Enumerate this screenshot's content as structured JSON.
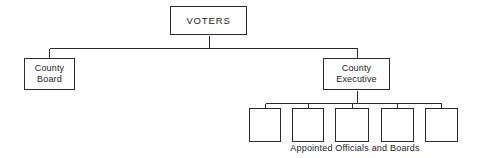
{
  "diagram": {
    "type": "organization-chart",
    "width": 482,
    "height": 158,
    "background_color": "#ffffff",
    "line_color": "#2b2b2b",
    "text_color": "#1a1a1a"
  },
  "nodes": {
    "voters": {
      "label": "VOTERS",
      "x": 170,
      "y": 6,
      "width": 77,
      "height": 29
    },
    "county_board": {
      "label": "County\nBoard",
      "x": 24,
      "y": 58,
      "width": 51,
      "height": 32
    },
    "county_executive": {
      "label": "County\nExecutive",
      "x": 323,
      "y": 58,
      "width": 67,
      "height": 32
    }
  },
  "appointed_boxes": [
    {
      "label": "",
      "x": 249,
      "y": 108,
      "width": 32,
      "height": 34
    },
    {
      "label": "",
      "x": 292,
      "y": 108,
      "width": 32,
      "height": 34
    },
    {
      "label": "",
      "x": 335,
      "y": 108,
      "width": 34,
      "height": 34
    },
    {
      "label": "",
      "x": 381,
      "y": 108,
      "width": 33,
      "height": 34
    },
    {
      "label": "",
      "x": 425,
      "y": 108,
      "width": 33,
      "height": 34
    }
  ],
  "captions": {
    "appointed": {
      "text": "Appointed  Officials  and  Boards",
      "x": 288,
      "y": 143,
      "width": 134
    }
  },
  "connectors": {
    "voters_stem": {
      "x": 209,
      "y1": 35,
      "y2": 48
    },
    "top_bus": {
      "y": 48,
      "x1": 49,
      "x2": 357
    },
    "board_stem": {
      "x": 49,
      "y1": 48,
      "y2": 58
    },
    "executive_stem": {
      "x": 357,
      "y1": 48,
      "y2": 58
    },
    "executive_down": {
      "x": 357,
      "y1": 90,
      "y2": 103
    },
    "lower_bus": {
      "y": 103,
      "x1": 265,
      "x2": 441
    },
    "appointed_stems": [
      {
        "x": 265,
        "y1": 103,
        "y2": 108
      },
      {
        "x": 308,
        "y1": 103,
        "y2": 108
      },
      {
        "x": 352,
        "y1": 103,
        "y2": 108
      },
      {
        "x": 397,
        "y1": 103,
        "y2": 108
      },
      {
        "x": 441,
        "y1": 103,
        "y2": 108
      }
    ]
  }
}
